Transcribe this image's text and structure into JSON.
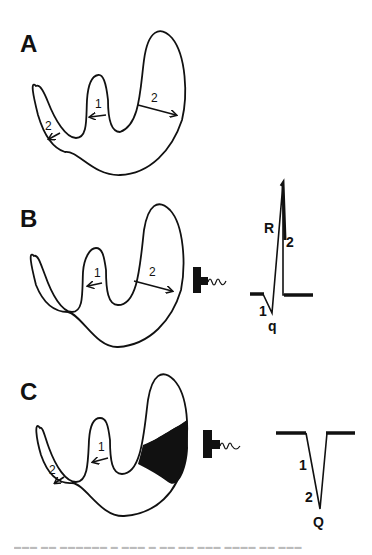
{
  "figure": {
    "panels": [
      {
        "id": "A",
        "label": "A",
        "heart_arrows": [
          {
            "label": "1",
            "direction": "left",
            "location": "septum"
          },
          {
            "label": "2",
            "direction": "right",
            "location": "right ventricular free wall (lateral)"
          },
          {
            "label": "2",
            "direction": "down-left",
            "location": "left ventricular wall"
          }
        ]
      },
      {
        "id": "B",
        "label": "B",
        "heart_arrows": [
          {
            "label": "1",
            "direction": "left",
            "location": "septum"
          },
          {
            "label": "2",
            "direction": "right",
            "location": "lateral wall"
          }
        ],
        "electrode": "electrode-icon",
        "ecg": {
          "waves": [
            "q",
            "R"
          ],
          "labels": {
            "q": "q",
            "R": "R",
            "phase1": "1",
            "phase2": "2"
          }
        }
      },
      {
        "id": "C",
        "label": "C",
        "heart_arrows": [
          {
            "label": "1",
            "direction": "left",
            "location": "septum"
          },
          {
            "label": "2",
            "direction": "down-left",
            "location": "left ventricular wall"
          }
        ],
        "infarct": "shaded necrotic region",
        "electrode": "electrode-icon",
        "ecg": {
          "waves": [
            "Q"
          ],
          "labels": {
            "Q": "Q",
            "phase1": "1",
            "phase2": "2"
          }
        }
      }
    ],
    "caption": "Fig. ... (caption text cut off / illegible)"
  },
  "text": {
    "A": "A",
    "B": "B",
    "C": "C",
    "one": "1",
    "two": "2",
    "q": "q",
    "R": "R",
    "Q": "Q",
    "caption": "▬▬▬ ▬▬  ▬▬▬▬▬▬ ▬ ▬▬▬ ▬ ▬▬ ▬▬ ▬▬▬ ▬▬▬▬ ▬▬ ▬▬▬"
  }
}
